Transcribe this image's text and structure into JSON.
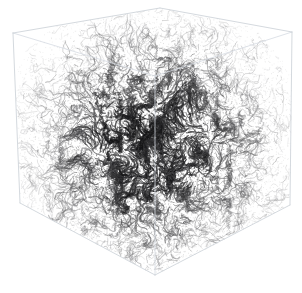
{
  "figure": {
    "type": "3d-volume-rendering",
    "title": "",
    "caption": "",
    "background_color": "#ffffff",
    "width": 302,
    "height": 293
  },
  "bounding_box": {
    "name": "wireframe-cube",
    "visible": true,
    "edge_color": "#c9cfd6",
    "edge_color_interior": "#d6dbe2",
    "edge_width": 0.8,
    "projection": "oblique-isometric",
    "vertices": {
      "front_top_left": [
        13,
        33
      ],
      "front_top_right": [
        292,
        32
      ],
      "back_top": [
        160,
        8
      ],
      "back_center": [
        155,
        76
      ],
      "front_left": [
        20,
        203
      ],
      "front_right": [
        290,
        205
      ],
      "front_bottom": [
        155,
        275
      ],
      "back_left_top": [
        13,
        33
      ],
      "back_right_top": [
        292,
        32
      ]
    },
    "edges": [
      {
        "name": "top-left-front",
        "from": [
          13,
          33
        ],
        "to": [
          160,
          8
        ]
      },
      {
        "name": "top-right-front",
        "from": [
          160,
          8
        ],
        "to": [
          292,
          32
        ]
      },
      {
        "name": "front-left-vertical",
        "from": [
          13,
          33
        ],
        "to": [
          20,
          203
        ]
      },
      {
        "name": "front-right-vertical",
        "from": [
          292,
          32
        ],
        "to": [
          290,
          205
        ]
      },
      {
        "name": "bottom-left-front",
        "from": [
          20,
          203
        ],
        "to": [
          155,
          275
        ]
      },
      {
        "name": "bottom-right-front",
        "from": [
          155,
          275
        ],
        "to": [
          290,
          205
        ]
      },
      {
        "name": "interior-back-vertical",
        "from": [
          155,
          76
        ],
        "to": [
          155,
          275
        ]
      },
      {
        "name": "interior-back-left",
        "from": [
          13,
          33
        ],
        "to": [
          155,
          76
        ]
      },
      {
        "name": "interior-back-right",
        "from": [
          292,
          32
        ],
        "to": [
          155,
          76
        ]
      }
    ]
  },
  "volume_field": {
    "name": "vorticity-filaments",
    "ink_color": "#2b2b2b",
    "mid_color": "#6e6e6e",
    "light_color": "#a8a8a8",
    "strand_count": 5200,
    "density_profile": "gaussian-centered",
    "center": [
      152,
      145
    ],
    "radius_x": 120,
    "radius_y": 118,
    "description": "dense tangled filamentary structure, darkest at the cube center, thinning toward the cube faces and corners"
  },
  "chart_data": {
    "type": "scatter",
    "title": "",
    "xlabel": "",
    "ylabel": "",
    "grid": false,
    "legend": null
  }
}
